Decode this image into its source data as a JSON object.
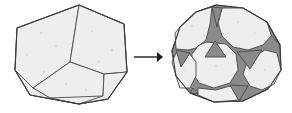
{
  "figure": {
    "transform_symbol": "→",
    "colors": {
      "face_light": "#eeeeec",
      "face_dark": "#8a8a8a",
      "edge": "#4a4a4a",
      "outline": "#3a3a3a",
      "arrow": "#1a1a1a",
      "background": "#ffffff"
    },
    "left_shape": {
      "name": "dodecahedron",
      "label": "",
      "face_count": 12,
      "face_shape": "pentagon",
      "bounds": {
        "x": 14,
        "y": 5,
        "width": 113,
        "height": 100
      },
      "outline": "79,5 124,24 127,72 108,99 79,104 30,95 15,70 17,28",
      "faces": [
        {
          "id": "top-left-pentagon",
          "fill": "light",
          "points": "79,5 30,21 15,70 33,88 70,62"
        },
        {
          "id": "top-right-pentagon",
          "fill": "light",
          "points": "79,5 124,24 127,72 104,74 70,62"
        },
        {
          "id": "bottom-center-pentagon",
          "fill": "light",
          "points": "70,62 104,74 103,96 50,98 33,88"
        },
        {
          "id": "bottom-left-sliver",
          "fill": "light",
          "points": "15,70 33,88 50,98 30,95"
        },
        {
          "id": "bottom-right-sliver",
          "fill": "light",
          "points": "104,74 127,72 108,99 103,96"
        },
        {
          "id": "top-edge-sliver",
          "fill": "light",
          "points": "79,5 30,21 17,28 79,5"
        }
      ],
      "edges": [
        "79,5 70,62",
        "70,62 30,21",
        "70,62 104,74",
        "33,88 70,62",
        "104,74 127,72",
        "33,88 50,98",
        "104,74 103,96",
        "15,70 33,88",
        "30,21 15,70",
        "79,5 124,24",
        "124,24 127,72",
        "127,72 108,99",
        "108,99 79,104",
        "79,104 30,95",
        "30,95 15,70",
        "15,70 17,28",
        "17,28 79,5",
        "50,98 79,104",
        "103,96 108,99"
      ]
    },
    "arrow": {
      "name": "transform-arrow",
      "from_x": 134,
      "to_x": 163,
      "y": 57
    },
    "right_shape": {
      "name": "truncated-dodecahedron",
      "label": "",
      "face_count": 32,
      "face_shapes": [
        "decagon",
        "triangle"
      ],
      "triangle_count_visible": 7,
      "bounds": {
        "x": 172,
        "y": 5,
        "width": 110,
        "height": 98
      },
      "outline": "216,5 243,8 267,22 280,45 281,70 268,89 243,101 214,102 190,93 176,76 172,51 180,27 196,12",
      "light_faces": [
        {
          "id": "top-left-decagon",
          "fill": "light",
          "points": "196,12 216,7 210,24 206,40 196,48 184,51 176,49 175,33 180,27"
        },
        {
          "id": "top-right-decagon",
          "fill": "light",
          "points": "222,8 243,8 267,22 272,34 263,45 248,50 233,47 222,36 218,22"
        },
        {
          "id": "center-decagon",
          "fill": "light",
          "points": "206,42 226,44 236,54 238,70 230,83 214,88 199,83 191,70 192,54"
        },
        {
          "id": "left-decagon",
          "fill": "light",
          "points": "176,53 189,51 196,60 196,76 190,88 180,88 176,76 172,62"
        },
        {
          "id": "right-decagon",
          "fill": "light",
          "points": "265,50 277,53 281,70 274,84 262,90 250,86 243,74 248,60"
        },
        {
          "id": "bottom-decagon",
          "fill": "light",
          "points": "216,90 233,86 242,92 240,100 214,102 197,95 198,88"
        },
        {
          "id": "upper-left-small",
          "fill": "light",
          "points": "188,49 196,48 196,52 189,52"
        }
      ],
      "dark_faces": [
        {
          "id": "triangle-top",
          "fill": "dark",
          "points": "212,7 222,8 217,26"
        },
        {
          "id": "triangle-center-up",
          "fill": "dark",
          "points": "205,57 215,41 226,57"
        },
        {
          "id": "triangle-mid-right",
          "fill": "dark",
          "points": "237,52 262,50 250,68"
        },
        {
          "id": "triangle-left",
          "fill": "dark",
          "points": "176,50 190,52 181,66"
        },
        {
          "id": "triangle-bottom",
          "fill": "dark",
          "points": "230,85 248,86 239,101"
        },
        {
          "id": "triangle-upper-right-edge",
          "fill": "dark",
          "points": "268,24 280,45 272,36"
        },
        {
          "id": "triangle-lower-left-edge",
          "fill": "dark",
          "points": "191,89 198,94 190,93"
        }
      ],
      "edges": [
        "216,5 222,8",
        "212,7 216,5",
        "217,26 222,8",
        "217,26 212,7",
        "210,24 217,26",
        "218,22 217,26",
        "206,42 210,24",
        "222,36 218,22",
        "205,57 215,41",
        "215,41 226,57",
        "205,57 226,57",
        "237,52 262,50",
        "262,50 250,68",
        "237,52 250,68",
        "176,50 190,52",
        "190,52 181,66",
        "176,50 181,66",
        "230,85 248,86",
        "248,86 239,101",
        "230,85 239,101",
        "196,48 206,42",
        "226,44 233,47",
        "236,54 243,60",
        "238,70 243,74",
        "230,83 233,86",
        "214,88 216,90",
        "199,83 197,88",
        "191,70 189,72",
        "192,54 190,52",
        "196,60 196,76",
        "248,60 243,74",
        "265,50 262,50",
        "277,53 281,70",
        "272,34 267,22",
        "263,45 265,50",
        "180,88 190,93",
        "214,102 216,90",
        "242,92 243,101",
        "172,51 176,49",
        "180,27 196,12"
      ]
    }
  }
}
